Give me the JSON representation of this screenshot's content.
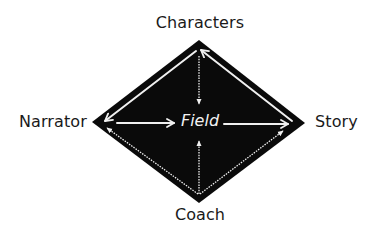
{
  "diagram": {
    "type": "diamond-relationship",
    "nodes": {
      "top": {
        "label": "Characters"
      },
      "left": {
        "label": "Narrator"
      },
      "right": {
        "label": "Story"
      },
      "bottom": {
        "label": "Coach"
      },
      "center": {
        "label": "Field"
      }
    },
    "edges": [
      {
        "from": "Characters",
        "to": "Narrator",
        "style": "solid"
      },
      {
        "from": "Story",
        "to": "Characters",
        "style": "solid"
      },
      {
        "from": "Narrator",
        "to": "Field",
        "style": "solid"
      },
      {
        "from": "Field",
        "to": "Story",
        "style": "solid"
      },
      {
        "from": "Characters",
        "to": "Field",
        "style": "dotted"
      },
      {
        "from": "Coach",
        "to": "Field",
        "style": "dotted"
      },
      {
        "from": "Coach",
        "to": "Narrator",
        "style": "dotted"
      },
      {
        "from": "Coach",
        "to": "Story",
        "style": "dotted"
      }
    ],
    "colors": {
      "diamond_fill": "#0a0a0a",
      "arrow_color": "#f0f0f0",
      "label_color": "#1a1a1a",
      "background": "#ffffff"
    }
  }
}
